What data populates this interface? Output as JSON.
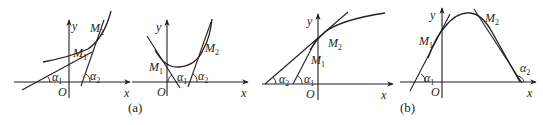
{
  "figure": {
    "panels": [
      {
        "id": "a1",
        "axis_labels": {
          "x": "x",
          "y": "y",
          "origin": "O"
        },
        "points": [
          {
            "label": "M",
            "sub": "1"
          },
          {
            "label": "M",
            "sub": "2"
          }
        ],
        "angles": [
          {
            "label": "α",
            "sub": "1"
          },
          {
            "label": "α",
            "sub": "2"
          }
        ],
        "description": "increasing convex curve; tangent at M2 steeper than at M1 (α2 > α1)"
      },
      {
        "id": "a2",
        "axis_labels": {
          "x": "x",
          "y": "y",
          "origin": "O"
        },
        "points": [
          {
            "label": "M",
            "sub": "1"
          },
          {
            "label": "M",
            "sub": "2"
          }
        ],
        "angles": [
          {
            "label": "α",
            "sub": "1"
          },
          {
            "label": "α",
            "sub": "2"
          }
        ],
        "description": "U-shaped convex curve; tangent slope increases from M1 to M2"
      },
      {
        "id": "b1",
        "axis_labels": {
          "x": "x",
          "y": "y",
          "origin": "O"
        },
        "points": [
          {
            "label": "M",
            "sub": "1"
          },
          {
            "label": "M",
            "sub": "2"
          }
        ],
        "angles": [
          {
            "label": "α",
            "sub": "2"
          },
          {
            "label": "α",
            "sub": "1"
          }
        ],
        "description": "increasing concave curve; tangent at M2 flatter than at M1"
      },
      {
        "id": "b2",
        "axis_labels": {
          "x": "x",
          "y": "y",
          "origin": "O"
        },
        "points": [
          {
            "label": "M",
            "sub": "1"
          },
          {
            "label": "M",
            "sub": "2"
          }
        ],
        "angles": [
          {
            "label": "α",
            "sub": "1"
          },
          {
            "label": "α",
            "sub": "2"
          }
        ],
        "description": "arch-shaped concave curve; tangent slope decreases from M1 to M2"
      }
    ],
    "captions": {
      "a": "(a)",
      "b": "(b)"
    }
  }
}
